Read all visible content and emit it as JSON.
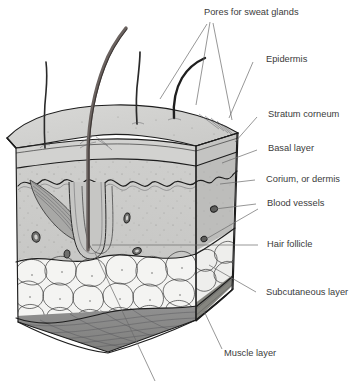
{
  "figure": {
    "background_color": "#ffffff",
    "line_color": "#1d1d1d",
    "label_color": "#3b3b3b",
    "leader_color": "#6a6a6a"
  },
  "labels": {
    "pores": "Pores for sweat glands",
    "epidermis": "Epidermis",
    "stratum_corneum": "Stratum corneum",
    "basal_layer": "Basal layer",
    "corium": "Corium, or dermis",
    "blood_vessels": "Blood vessels",
    "hair_follicle": "Hair follicle",
    "subcutaneous": "Subcutaneous layer",
    "muscle": "Muscle layer"
  },
  "layers": [
    {
      "name": "stratum-corneum",
      "label": "Stratum corneum",
      "fill": "#d4d4d2"
    },
    {
      "name": "epidermis",
      "label": "Epidermis",
      "fill": "#cdcdcb"
    },
    {
      "name": "basal-layer",
      "label": "Basal layer",
      "fill": "#c6c6c4"
    },
    {
      "name": "corium-dermis",
      "label": "Corium, or dermis",
      "fill": "#c9c9c7"
    },
    {
      "name": "subcutaneous-layer",
      "label": "Subcutaneous layer",
      "fill": "#f2f2f0"
    },
    {
      "name": "muscle-layer",
      "label": "Muscle layer",
      "fill": "#8d8d8b"
    }
  ],
  "features": {
    "hair_count": 4,
    "blood_vessel_count": 6,
    "fat_lobule_count": 18
  }
}
